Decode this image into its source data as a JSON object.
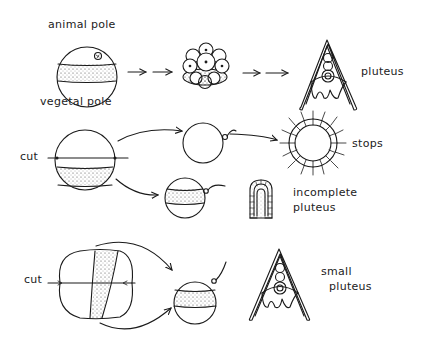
{
  "diagram": {
    "type": "embryology-experiment-schematic",
    "rows": [
      {
        "id": "intact",
        "stages": [
          "egg",
          "cleavage-embryo",
          "pluteus"
        ],
        "labels": {
          "animal_pole": "animal pole",
          "vegetal_pole": "vegetal pole",
          "result": "pluteus"
        }
      },
      {
        "id": "horizontal-cut",
        "cut_label": "cut",
        "outcomes": [
          {
            "fragment": "animal half",
            "result": "stops"
          },
          {
            "fragment": "vegetal half",
            "result_line1": "incomplete",
            "result_line2": "pluteus"
          }
        ]
      },
      {
        "id": "vertical-cut",
        "cut_label": "cut",
        "outcomes": [
          {
            "fragment": "meridional half",
            "result_line1": "small",
            "result_line2": "pluteus"
          }
        ]
      }
    ],
    "colors": {
      "ink": "#1a1a1a",
      "background": "#ffffff",
      "stipple": "#555555"
    }
  }
}
